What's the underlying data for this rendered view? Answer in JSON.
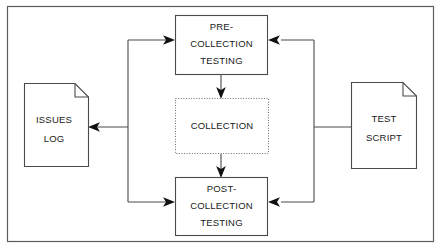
{
  "diagram": {
    "frame": {
      "border_color": "#5c5c5c",
      "background": "#ffffff"
    },
    "nodes": [
      {
        "id": "pre-collection-testing",
        "kind": "process-box",
        "border_style": "solid",
        "lines": [
          "PRE-",
          "COLLECTION",
          "TESTING"
        ]
      },
      {
        "id": "collection",
        "kind": "process-box",
        "border_style": "dotted",
        "lines": [
          "COLLECTION"
        ]
      },
      {
        "id": "post-collection-testing",
        "kind": "process-box",
        "border_style": "solid",
        "lines": [
          "POST-",
          "COLLECTION",
          "TESTING"
        ]
      },
      {
        "id": "issues-log",
        "kind": "document",
        "lines": [
          "ISSUES",
          "LOG"
        ]
      },
      {
        "id": "test-script",
        "kind": "document",
        "lines": [
          "TEST",
          "SCRIPT"
        ]
      }
    ],
    "edges": [
      {
        "id": "pre-to-collection",
        "from": "pre-collection-testing",
        "to": "collection",
        "arrow": "down"
      },
      {
        "id": "collection-to-post",
        "from": "collection",
        "to": "post-collection-testing",
        "arrow": "down"
      },
      {
        "id": "test-script-to-pre",
        "from": "test-script",
        "to": "pre-collection-testing",
        "arrow": "left"
      },
      {
        "id": "test-script-to-post",
        "from": "test-script",
        "to": "post-collection-testing",
        "arrow": "left"
      },
      {
        "id": "pre-to-issues-log",
        "from": "pre-collection-testing",
        "to": "issues-log",
        "arrow": "left"
      },
      {
        "id": "post-to-issues-log",
        "from": "post-collection-testing",
        "to": "issues-log",
        "arrow": "left"
      }
    ]
  },
  "labels": {
    "pre_line1": "PRE-",
    "pre_line2": "COLLECTION",
    "pre_line3": "TESTING",
    "collection": "COLLECTION",
    "post_line1": "POST-",
    "post_line2": "COLLECTION",
    "post_line3": "TESTING",
    "issues_line1": "ISSUES",
    "issues_line2": "LOG",
    "script_line1": "TEST",
    "script_line2": "SCRIPT"
  },
  "colors": {
    "stroke": "#4a4a4a",
    "arrow": "#111111",
    "dotted_stroke": "#6e6e6e",
    "frame": "#5c5c5c",
    "text": "#1a1a1a",
    "background": "#ffffff"
  }
}
